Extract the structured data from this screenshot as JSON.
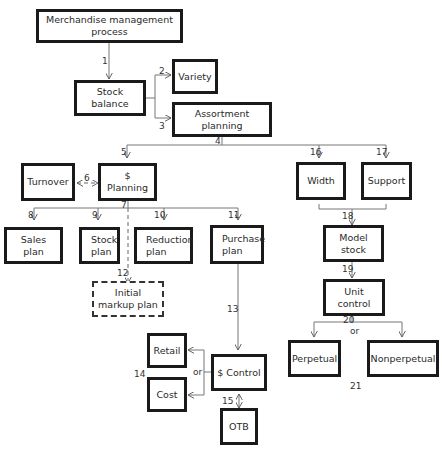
{
  "diagram": {
    "type": "flowchart",
    "nodes": {
      "merchandise_management_process": "Merchandise management process",
      "stock_balance": "Stock balance",
      "variety": "Variety",
      "assortment_planning": "Assortment planning",
      "turnover": "Turnover",
      "dollar_planning": "$ Planning",
      "width": "Width",
      "support": "Support",
      "sales_plan": "Sales plan",
      "stock_plan": "Stock plan",
      "reduction_plan": "Reduction plan",
      "purchase_plan": "Purchase plan",
      "model_stock": "Model stock",
      "initial_markup_plan": "Initial markup plan",
      "unit_control": "Unit control",
      "retail": "Retail",
      "cost": "Cost",
      "dollar_control": "$ Control",
      "perpetual": "Perpetual",
      "nonperpetual": "Nonperpetual",
      "otb": "OTB"
    },
    "edge_labels": {
      "e1": "1",
      "e2": "2",
      "e3": "3",
      "e4": "4",
      "e5": "5",
      "e6": "6",
      "e7": "7",
      "e8": "8",
      "e9": "9",
      "e10": "10",
      "e11": "11",
      "e12": "12",
      "e13": "13",
      "e14": "14",
      "e15": "15",
      "e16": "16",
      "e17": "17",
      "e18": "18",
      "e19": "19",
      "e20": "20",
      "e21": "21"
    },
    "or_labels": {
      "dollar_control_or": "or",
      "unit_control_or": "or"
    },
    "edges": [
      {
        "from": "Merchandise management process",
        "to": "Stock balance",
        "label": "1"
      },
      {
        "from": "Stock balance",
        "to": "Variety",
        "label": "2"
      },
      {
        "from": "Stock balance",
        "to": "Assortment planning",
        "label": "3"
      },
      {
        "from": "Assortment planning",
        "to": "$ Planning",
        "label": "4/5"
      },
      {
        "from": "$ Planning",
        "to": "Turnover",
        "label": "6",
        "style": "dashed-bidirectional"
      },
      {
        "from": "$ Planning",
        "to": "Sales plan",
        "label": "7/8"
      },
      {
        "from": "$ Planning",
        "to": "Stock plan",
        "label": "9"
      },
      {
        "from": "$ Planning",
        "to": "Reduction plan",
        "label": "10"
      },
      {
        "from": "$ Planning",
        "to": "Purchase plan",
        "label": "11"
      },
      {
        "from": "$ Planning",
        "to": "Initial markup plan",
        "label": "12",
        "style": "dashed"
      },
      {
        "from": "Purchase plan",
        "to": "$ Control",
        "label": "13"
      },
      {
        "from": "$ Control",
        "to": "Retail or Cost",
        "label": "14"
      },
      {
        "from": "$ Control",
        "to": "OTB",
        "label": "15",
        "style": "bidirectional"
      },
      {
        "from": "Assortment planning",
        "to": "Width",
        "label": "16"
      },
      {
        "from": "Assortment planning",
        "to": "Support",
        "label": "17"
      },
      {
        "from": "Width + Support",
        "to": "Model stock",
        "label": "18"
      },
      {
        "from": "Model stock",
        "to": "Unit control",
        "label": "19"
      },
      {
        "from": "Unit control",
        "to": "Perpetual or Nonperpetual",
        "label": "20/21"
      }
    ]
  }
}
